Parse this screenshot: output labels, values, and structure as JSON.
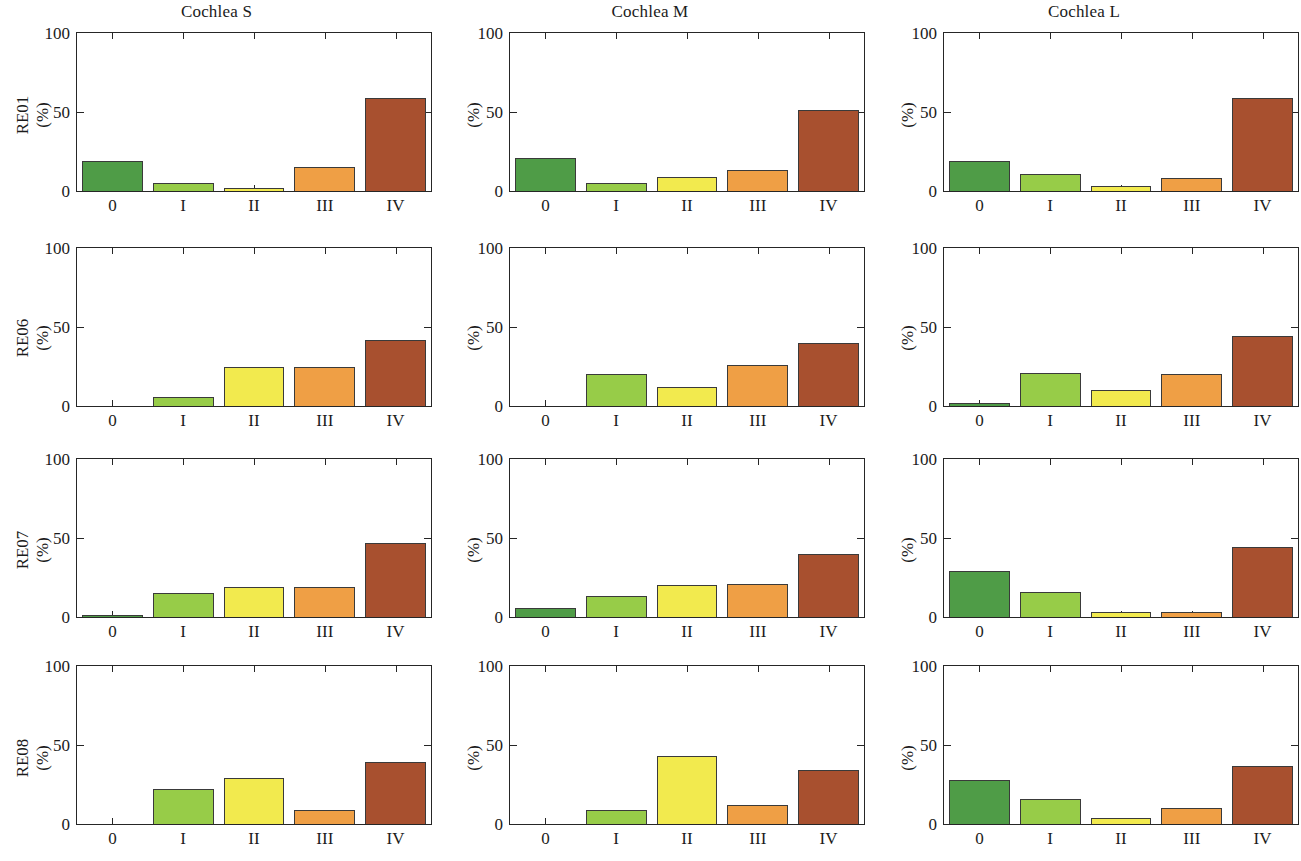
{
  "figure": {
    "column_titles": [
      "Cochlea S",
      "Cochlea M",
      "Cochlea L"
    ],
    "row_labels": [
      "RE01",
      "RE06",
      "RE07",
      "RE08"
    ],
    "unit_label": "(%)",
    "x_tick_labels": [
      "0",
      "I",
      "II",
      "III",
      "IV"
    ],
    "y_tick_labels": [
      "100",
      "50",
      "0"
    ]
  },
  "colors": {
    "grade_0": "#4f9c47",
    "grade_I": "#97cc48",
    "grade_II": "#f2ea4e",
    "grade_III": "#ef9f45",
    "grade_IV": "#a8502f",
    "axis": "#262626",
    "text": "#1b1b1b",
    "background": "#ffffff"
  },
  "chart_data": {
    "type": "bar",
    "title": "",
    "xlabel": "",
    "ylabel": "(%)",
    "ylim": [
      0,
      100
    ],
    "yticks": [
      0,
      50,
      100
    ],
    "grid": false,
    "legend": "none",
    "categories": [
      "0",
      "I",
      "II",
      "III",
      "IV"
    ],
    "category_colors": [
      "#4f9c47",
      "#97cc48",
      "#f2ea4e",
      "#ef9f45",
      "#a8502f"
    ],
    "panel_rows": [
      "RE01",
      "RE06",
      "RE07",
      "RE08"
    ],
    "panel_columns": [
      "Cochlea S",
      "Cochlea M",
      "Cochlea L"
    ],
    "panels": [
      {
        "row": "RE01",
        "column": "Cochlea S",
        "values": [
          19,
          5,
          2,
          15,
          59
        ]
      },
      {
        "row": "RE01",
        "column": "Cochlea M",
        "values": [
          21,
          5,
          9,
          13,
          51
        ]
      },
      {
        "row": "RE01",
        "column": "Cochlea L",
        "values": [
          19,
          11,
          3,
          8,
          59
        ]
      },
      {
        "row": "RE06",
        "column": "Cochlea S",
        "values": [
          0,
          6,
          25,
          25,
          42
        ]
      },
      {
        "row": "RE06",
        "column": "Cochlea M",
        "values": [
          0,
          20,
          12,
          26,
          40
        ]
      },
      {
        "row": "RE06",
        "column": "Cochlea L",
        "values": [
          2,
          21,
          10,
          20,
          44
        ]
      },
      {
        "row": "RE07",
        "column": "Cochlea S",
        "values": [
          1,
          15,
          19,
          19,
          47
        ]
      },
      {
        "row": "RE07",
        "column": "Cochlea M",
        "values": [
          6,
          13,
          20,
          21,
          40
        ]
      },
      {
        "row": "RE07",
        "column": "Cochlea L",
        "values": [
          29,
          16,
          3,
          3,
          44
        ]
      },
      {
        "row": "RE08",
        "column": "Cochlea S",
        "values": [
          0,
          22,
          29,
          9,
          39
        ]
      },
      {
        "row": "RE08",
        "column": "Cochlea M",
        "values": [
          0,
          9,
          43,
          12,
          34
        ]
      },
      {
        "row": "RE08",
        "column": "Cochlea L",
        "values": [
          28,
          16,
          4,
          10,
          37
        ]
      }
    ]
  }
}
